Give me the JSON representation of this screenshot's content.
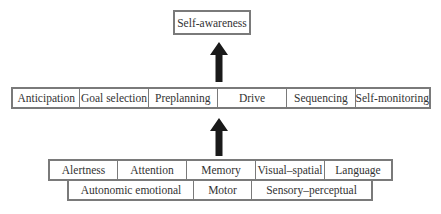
{
  "top": {
    "label": "Self-awareness"
  },
  "middle": {
    "items": [
      {
        "label": "Anticipation"
      },
      {
        "label": "Goal selection"
      },
      {
        "label": "Preplanning"
      },
      {
        "label": "Drive"
      },
      {
        "label": "Sequencing"
      },
      {
        "label": "Self-monitoring"
      }
    ]
  },
  "bottom": {
    "row1": [
      {
        "label": "Alertness"
      },
      {
        "label": "Attention"
      },
      {
        "label": "Memory"
      },
      {
        "label": "Visual–spatial"
      },
      {
        "label": "Language"
      }
    ],
    "row2": [
      {
        "label": "Autonomic emotional"
      },
      {
        "label": "Motor"
      },
      {
        "label": "Sensory–perceptual"
      }
    ]
  },
  "arrows": [
    {
      "name": "arrow-middle-to-top",
      "direction": "up"
    },
    {
      "name": "arrow-bottom-to-middle",
      "direction": "up"
    }
  ],
  "colors": {
    "border": "#7a7a7a",
    "arrow": "#1a1a1a",
    "text": "#333333"
  }
}
